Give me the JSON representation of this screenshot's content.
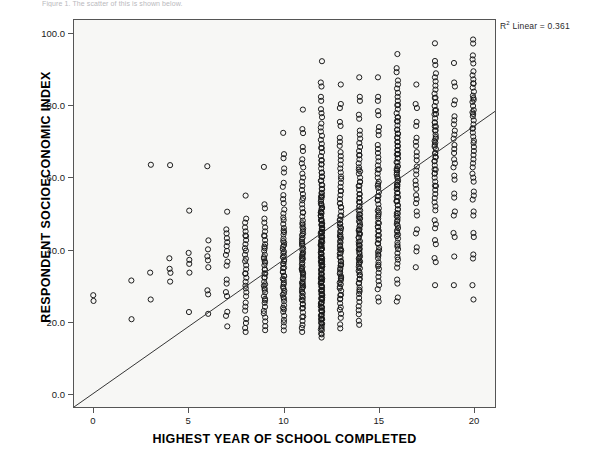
{
  "caption": {
    "text": "Figure 1. The scatter of this is shown below."
  },
  "annotation": {
    "r_squared_prefix": "R",
    "r_squared_sup": "2",
    "r_squared_text": " Linear = 0.361"
  },
  "axes": {
    "y_title": "RESPONDENT SOCIOECONOMIC INDEX",
    "x_title": "HIGHEST YEAR OF SCHOOL COMPLETED",
    "y_tick_labels": [
      "0.0",
      "20.0",
      "40.0",
      "60.0",
      "80.0",
      "100.0"
    ],
    "x_tick_labels": [
      "0",
      "5",
      "10",
      "15",
      "20"
    ]
  },
  "colors": {
    "plot_background": "#f7f7f5",
    "frame": "#555555",
    "marker": "#1a1a1a",
    "fit_line": "#333333",
    "text": "#000000"
  },
  "chart_data": {
    "type": "scatter",
    "title": "",
    "xlabel": "HIGHEST YEAR OF SCHOOL COMPLETED",
    "ylabel": "RESPONDENT SOCIOECONOMIC INDEX",
    "xlim": [
      -1.05,
      21.15
    ],
    "ylim": [
      -4.0,
      104.0
    ],
    "x_ticks": [
      0,
      5,
      10,
      15,
      20
    ],
    "y_ticks": [
      0,
      20,
      40,
      60,
      80,
      100
    ],
    "grid": false,
    "legend": null,
    "marker_style": "open-circle",
    "marker_size_px": 5.2,
    "annotations": [
      {
        "text": "R² Linear = 0.361",
        "position": "top-right-outside"
      }
    ],
    "fit_line": {
      "type": "linear",
      "r_squared": 0.361,
      "slope": 3.72,
      "intercept": -4.9,
      "x_start": -1.05,
      "y_start": -4.0,
      "x_end": 21.15,
      "y_end": 78.5
    },
    "note": "Counts give the number of overplotted open-circle markers at each (x, y) grid location.",
    "points": [
      {
        "x": 0,
        "y": 25.6,
        "n": 1
      },
      {
        "x": 0,
        "y": 27.2,
        "n": 1
      },
      {
        "x": 2,
        "y": 31.3,
        "n": 1
      },
      {
        "x": 2,
        "y": 20.5,
        "n": 1
      },
      {
        "x": 3,
        "y": 63.6,
        "n": 1
      },
      {
        "x": 3,
        "y": 33.5,
        "n": 1
      },
      {
        "x": 3,
        "y": 26.0,
        "n": 1
      },
      {
        "x": 4,
        "y": 63.5,
        "n": 1
      },
      {
        "x": 4,
        "y": 37.5,
        "n": 1
      },
      {
        "x": 4,
        "y": 34.0,
        "n": 2
      },
      {
        "x": 4,
        "y": 31.0,
        "n": 1
      },
      {
        "x": 5,
        "y": 50.8,
        "n": 1
      },
      {
        "x": 5,
        "y": 39.0,
        "n": 1
      },
      {
        "x": 5,
        "y": 36.5,
        "n": 2
      },
      {
        "x": 5,
        "y": 33.5,
        "n": 1
      },
      {
        "x": 5,
        "y": 22.5,
        "n": 1
      },
      {
        "x": 6,
        "y": 63.2,
        "n": 1
      },
      {
        "x": 6,
        "y": 42.5,
        "n": 1
      },
      {
        "x": 6,
        "y": 40.0,
        "n": 1
      },
      {
        "x": 6,
        "y": 37.5,
        "n": 2
      },
      {
        "x": 6,
        "y": 35.0,
        "n": 1
      },
      {
        "x": 6,
        "y": 28.0,
        "n": 2
      },
      {
        "x": 6,
        "y": 22.0,
        "n": 1
      },
      {
        "x": 7,
        "y": 50.5,
        "n": 1
      },
      {
        "x": 7,
        "y": 45.0,
        "n": 2
      },
      {
        "x": 7,
        "y": 42.0,
        "n": 3
      },
      {
        "x": 7,
        "y": 39.0,
        "n": 2
      },
      {
        "x": 7,
        "y": 36.0,
        "n": 2
      },
      {
        "x": 7,
        "y": 31.0,
        "n": 2
      },
      {
        "x": 7,
        "y": 27.5,
        "n": 2
      },
      {
        "x": 7,
        "y": 22.0,
        "n": 2
      },
      {
        "x": 7,
        "y": 18.5,
        "n": 1
      },
      {
        "x": 8,
        "y": 55.0,
        "n": 1
      },
      {
        "x": 8,
        "y": 48.0,
        "n": 2
      },
      {
        "x": 8,
        "y": 45.0,
        "n": 3
      },
      {
        "x": 8,
        "y": 42.0,
        "n": 4
      },
      {
        "x": 8,
        "y": 38.5,
        "n": 3
      },
      {
        "x": 8,
        "y": 35.0,
        "n": 4
      },
      {
        "x": 8,
        "y": 31.5,
        "n": 4
      },
      {
        "x": 8,
        "y": 28.0,
        "n": 3
      },
      {
        "x": 8,
        "y": 24.0,
        "n": 3
      },
      {
        "x": 8,
        "y": 20.0,
        "n": 2
      },
      {
        "x": 8,
        "y": 17.5,
        "n": 2
      },
      {
        "x": 9,
        "y": 63.0,
        "n": 1
      },
      {
        "x": 9,
        "y": 52.0,
        "n": 2
      },
      {
        "x": 9,
        "y": 48.0,
        "n": 2
      },
      {
        "x": 9,
        "y": 45.0,
        "n": 3
      },
      {
        "x": 9,
        "y": 42.0,
        "n": 4
      },
      {
        "x": 9,
        "y": 38.5,
        "n": 5
      },
      {
        "x": 9,
        "y": 35.0,
        "n": 6
      },
      {
        "x": 9,
        "y": 31.5,
        "n": 6
      },
      {
        "x": 9,
        "y": 28.0,
        "n": 5
      },
      {
        "x": 9,
        "y": 24.5,
        "n": 4
      },
      {
        "x": 9,
        "y": 21.0,
        "n": 3
      },
      {
        "x": 9,
        "y": 18.0,
        "n": 2
      },
      {
        "x": 10,
        "y": 72.5,
        "n": 1
      },
      {
        "x": 10,
        "y": 66.0,
        "n": 2
      },
      {
        "x": 10,
        "y": 62.0,
        "n": 2
      },
      {
        "x": 10,
        "y": 58.0,
        "n": 2
      },
      {
        "x": 10,
        "y": 54.0,
        "n": 3
      },
      {
        "x": 10,
        "y": 50.0,
        "n": 3
      },
      {
        "x": 10,
        "y": 46.5,
        "n": 4
      },
      {
        "x": 10,
        "y": 43.0,
        "n": 5
      },
      {
        "x": 10,
        "y": 39.5,
        "n": 6
      },
      {
        "x": 10,
        "y": 36.0,
        "n": 7
      },
      {
        "x": 10,
        "y": 32.5,
        "n": 7
      },
      {
        "x": 10,
        "y": 29.0,
        "n": 6
      },
      {
        "x": 10,
        "y": 25.5,
        "n": 5
      },
      {
        "x": 10,
        "y": 22.0,
        "n": 4
      },
      {
        "x": 10,
        "y": 18.5,
        "n": 3
      },
      {
        "x": 11,
        "y": 79.0,
        "n": 1
      },
      {
        "x": 11,
        "y": 73.0,
        "n": 2
      },
      {
        "x": 11,
        "y": 68.0,
        "n": 2
      },
      {
        "x": 11,
        "y": 64.0,
        "n": 3
      },
      {
        "x": 11,
        "y": 60.0,
        "n": 3
      },
      {
        "x": 11,
        "y": 56.0,
        "n": 4
      },
      {
        "x": 11,
        "y": 52.0,
        "n": 4
      },
      {
        "x": 11,
        "y": 48.0,
        "n": 5
      },
      {
        "x": 11,
        "y": 44.5,
        "n": 6
      },
      {
        "x": 11,
        "y": 41.0,
        "n": 7
      },
      {
        "x": 11,
        "y": 37.5,
        "n": 8
      },
      {
        "x": 11,
        "y": 34.0,
        "n": 9
      },
      {
        "x": 11,
        "y": 30.5,
        "n": 8
      },
      {
        "x": 11,
        "y": 27.0,
        "n": 7
      },
      {
        "x": 11,
        "y": 23.5,
        "n": 5
      },
      {
        "x": 11,
        "y": 20.0,
        "n": 3
      },
      {
        "x": 11,
        "y": 17.5,
        "n": 2
      },
      {
        "x": 12,
        "y": 92.5,
        "n": 1
      },
      {
        "x": 12,
        "y": 86.0,
        "n": 2
      },
      {
        "x": 12,
        "y": 82.0,
        "n": 2
      },
      {
        "x": 12,
        "y": 78.0,
        "n": 3
      },
      {
        "x": 12,
        "y": 74.0,
        "n": 3
      },
      {
        "x": 12,
        "y": 70.0,
        "n": 4
      },
      {
        "x": 12,
        "y": 66.0,
        "n": 5
      },
      {
        "x": 12,
        "y": 62.0,
        "n": 6
      },
      {
        "x": 12,
        "y": 58.0,
        "n": 7
      },
      {
        "x": 12,
        "y": 54.0,
        "n": 8
      },
      {
        "x": 12,
        "y": 50.0,
        "n": 10
      },
      {
        "x": 12,
        "y": 46.5,
        "n": 12
      },
      {
        "x": 12,
        "y": 43.0,
        "n": 14
      },
      {
        "x": 12,
        "y": 39.5,
        "n": 16
      },
      {
        "x": 12,
        "y": 36.0,
        "n": 18
      },
      {
        "x": 12,
        "y": 32.5,
        "n": 18
      },
      {
        "x": 12,
        "y": 29.0,
        "n": 16
      },
      {
        "x": 12,
        "y": 25.5,
        "n": 12
      },
      {
        "x": 12,
        "y": 22.0,
        "n": 8
      },
      {
        "x": 12,
        "y": 18.5,
        "n": 5
      },
      {
        "x": 12,
        "y": 16.5,
        "n": 3
      },
      {
        "x": 13,
        "y": 86.0,
        "n": 1
      },
      {
        "x": 13,
        "y": 80.0,
        "n": 2
      },
      {
        "x": 13,
        "y": 75.0,
        "n": 2
      },
      {
        "x": 13,
        "y": 70.0,
        "n": 3
      },
      {
        "x": 13,
        "y": 66.0,
        "n": 3
      },
      {
        "x": 13,
        "y": 62.0,
        "n": 4
      },
      {
        "x": 13,
        "y": 58.0,
        "n": 4
      },
      {
        "x": 13,
        "y": 54.0,
        "n": 5
      },
      {
        "x": 13,
        "y": 50.0,
        "n": 6
      },
      {
        "x": 13,
        "y": 46.5,
        "n": 6
      },
      {
        "x": 13,
        "y": 43.0,
        "n": 7
      },
      {
        "x": 13,
        "y": 39.5,
        "n": 8
      },
      {
        "x": 13,
        "y": 36.0,
        "n": 8
      },
      {
        "x": 13,
        "y": 32.5,
        "n": 7
      },
      {
        "x": 13,
        "y": 29.0,
        "n": 6
      },
      {
        "x": 13,
        "y": 25.5,
        "n": 4
      },
      {
        "x": 13,
        "y": 22.0,
        "n": 3
      },
      {
        "x": 13,
        "y": 18.5,
        "n": 2
      },
      {
        "x": 14,
        "y": 88.0,
        "n": 1
      },
      {
        "x": 14,
        "y": 82.0,
        "n": 2
      },
      {
        "x": 14,
        "y": 77.0,
        "n": 2
      },
      {
        "x": 14,
        "y": 72.0,
        "n": 3
      },
      {
        "x": 14,
        "y": 68.0,
        "n": 4
      },
      {
        "x": 14,
        "y": 64.0,
        "n": 5
      },
      {
        "x": 14,
        "y": 60.0,
        "n": 5
      },
      {
        "x": 14,
        "y": 56.0,
        "n": 6
      },
      {
        "x": 14,
        "y": 52.0,
        "n": 7
      },
      {
        "x": 14,
        "y": 48.0,
        "n": 8
      },
      {
        "x": 14,
        "y": 44.5,
        "n": 9
      },
      {
        "x": 14,
        "y": 41.0,
        "n": 9
      },
      {
        "x": 14,
        "y": 37.5,
        "n": 8
      },
      {
        "x": 14,
        "y": 34.0,
        "n": 7
      },
      {
        "x": 14,
        "y": 30.5,
        "n": 5
      },
      {
        "x": 14,
        "y": 27.0,
        "n": 4
      },
      {
        "x": 14,
        "y": 23.0,
        "n": 3
      },
      {
        "x": 14,
        "y": 19.5,
        "n": 2
      },
      {
        "x": 15,
        "y": 88.0,
        "n": 1
      },
      {
        "x": 15,
        "y": 82.0,
        "n": 2
      },
      {
        "x": 15,
        "y": 78.0,
        "n": 2
      },
      {
        "x": 15,
        "y": 73.0,
        "n": 3
      },
      {
        "x": 15,
        "y": 68.0,
        "n": 3
      },
      {
        "x": 15,
        "y": 64.0,
        "n": 4
      },
      {
        "x": 15,
        "y": 60.0,
        "n": 5
      },
      {
        "x": 15,
        "y": 56.0,
        "n": 5
      },
      {
        "x": 15,
        "y": 52.0,
        "n": 6
      },
      {
        "x": 15,
        "y": 48.0,
        "n": 6
      },
      {
        "x": 15,
        "y": 44.5,
        "n": 6
      },
      {
        "x": 15,
        "y": 41.0,
        "n": 6
      },
      {
        "x": 15,
        "y": 37.5,
        "n": 5
      },
      {
        "x": 15,
        "y": 34.0,
        "n": 4
      },
      {
        "x": 15,
        "y": 30.0,
        "n": 3
      },
      {
        "x": 15,
        "y": 26.0,
        "n": 2
      },
      {
        "x": 16,
        "y": 94.5,
        "n": 1
      },
      {
        "x": 16,
        "y": 90.0,
        "n": 2
      },
      {
        "x": 16,
        "y": 86.0,
        "n": 3
      },
      {
        "x": 16,
        "y": 82.0,
        "n": 4
      },
      {
        "x": 16,
        "y": 78.0,
        "n": 5
      },
      {
        "x": 16,
        "y": 74.0,
        "n": 6
      },
      {
        "x": 16,
        "y": 70.0,
        "n": 7
      },
      {
        "x": 16,
        "y": 66.0,
        "n": 8
      },
      {
        "x": 16,
        "y": 62.0,
        "n": 9
      },
      {
        "x": 16,
        "y": 58.0,
        "n": 9
      },
      {
        "x": 16,
        "y": 54.0,
        "n": 8
      },
      {
        "x": 16,
        "y": 50.0,
        "n": 7
      },
      {
        "x": 16,
        "y": 46.5,
        "n": 6
      },
      {
        "x": 16,
        "y": 43.0,
        "n": 5
      },
      {
        "x": 16,
        "y": 39.5,
        "n": 4
      },
      {
        "x": 16,
        "y": 36.0,
        "n": 3
      },
      {
        "x": 16,
        "y": 31.0,
        "n": 2
      },
      {
        "x": 16,
        "y": 26.0,
        "n": 2
      },
      {
        "x": 17,
        "y": 86.0,
        "n": 1
      },
      {
        "x": 17,
        "y": 80.0,
        "n": 2
      },
      {
        "x": 17,
        "y": 75.0,
        "n": 2
      },
      {
        "x": 17,
        "y": 70.0,
        "n": 3
      },
      {
        "x": 17,
        "y": 66.0,
        "n": 3
      },
      {
        "x": 17,
        "y": 62.0,
        "n": 3
      },
      {
        "x": 17,
        "y": 58.0,
        "n": 3
      },
      {
        "x": 17,
        "y": 54.0,
        "n": 3
      },
      {
        "x": 17,
        "y": 50.0,
        "n": 2
      },
      {
        "x": 17,
        "y": 45.0,
        "n": 2
      },
      {
        "x": 17,
        "y": 40.0,
        "n": 2
      },
      {
        "x": 17,
        "y": 35.0,
        "n": 1
      },
      {
        "x": 18,
        "y": 97.5,
        "n": 1
      },
      {
        "x": 18,
        "y": 92.0,
        "n": 2
      },
      {
        "x": 18,
        "y": 88.0,
        "n": 3
      },
      {
        "x": 18,
        "y": 84.0,
        "n": 4
      },
      {
        "x": 18,
        "y": 80.0,
        "n": 5
      },
      {
        "x": 18,
        "y": 76.0,
        "n": 6
      },
      {
        "x": 18,
        "y": 72.0,
        "n": 7
      },
      {
        "x": 18,
        "y": 68.0,
        "n": 7
      },
      {
        "x": 18,
        "y": 64.0,
        "n": 6
      },
      {
        "x": 18,
        "y": 60.0,
        "n": 5
      },
      {
        "x": 18,
        "y": 56.0,
        "n": 4
      },
      {
        "x": 18,
        "y": 52.0,
        "n": 3
      },
      {
        "x": 18,
        "y": 47.0,
        "n": 3
      },
      {
        "x": 18,
        "y": 42.0,
        "n": 2
      },
      {
        "x": 18,
        "y": 37.0,
        "n": 2
      },
      {
        "x": 18,
        "y": 30.0,
        "n": 1
      },
      {
        "x": 19,
        "y": 92.0,
        "n": 1
      },
      {
        "x": 19,
        "y": 86.0,
        "n": 2
      },
      {
        "x": 19,
        "y": 81.0,
        "n": 2
      },
      {
        "x": 19,
        "y": 76.0,
        "n": 3
      },
      {
        "x": 19,
        "y": 72.0,
        "n": 3
      },
      {
        "x": 19,
        "y": 68.0,
        "n": 3
      },
      {
        "x": 19,
        "y": 64.0,
        "n": 3
      },
      {
        "x": 19,
        "y": 60.0,
        "n": 2
      },
      {
        "x": 19,
        "y": 55.0,
        "n": 2
      },
      {
        "x": 19,
        "y": 50.0,
        "n": 2
      },
      {
        "x": 19,
        "y": 44.0,
        "n": 2
      },
      {
        "x": 19,
        "y": 38.0,
        "n": 1
      },
      {
        "x": 19,
        "y": 30.0,
        "n": 1
      },
      {
        "x": 20,
        "y": 98.0,
        "n": 2
      },
      {
        "x": 20,
        "y": 93.0,
        "n": 3
      },
      {
        "x": 20,
        "y": 88.0,
        "n": 4
      },
      {
        "x": 20,
        "y": 84.0,
        "n": 5
      },
      {
        "x": 20,
        "y": 80.0,
        "n": 5
      },
      {
        "x": 20,
        "y": 76.0,
        "n": 5
      },
      {
        "x": 20,
        "y": 72.0,
        "n": 4
      },
      {
        "x": 20,
        "y": 68.0,
        "n": 4
      },
      {
        "x": 20,
        "y": 64.0,
        "n": 3
      },
      {
        "x": 20,
        "y": 60.0,
        "n": 3
      },
      {
        "x": 20,
        "y": 55.0,
        "n": 3
      },
      {
        "x": 20,
        "y": 50.0,
        "n": 2
      },
      {
        "x": 20,
        "y": 44.0,
        "n": 2
      },
      {
        "x": 20,
        "y": 38.0,
        "n": 2
      },
      {
        "x": 20,
        "y": 30.0,
        "n": 1
      },
      {
        "x": 20,
        "y": 26.0,
        "n": 1
      }
    ]
  }
}
